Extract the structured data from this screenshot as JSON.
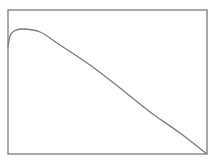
{
  "chart_data": {
    "type": "line",
    "title": "",
    "xlabel": "",
    "ylabel": "",
    "grid": false,
    "legend": null,
    "frame": {
      "x": 8,
      "y": 10,
      "width": 199,
      "height": 144
    },
    "colors": {
      "frame": "#8c8c8c",
      "line": "#7a7a7a",
      "background": "#ffffff"
    },
    "x": [
      0.0,
      0.01,
      0.03,
      0.07,
      0.16,
      0.26,
      0.41,
      0.56,
      0.71,
      0.86,
      1.0
    ],
    "values": [
      0.74,
      0.85,
      0.87,
      0.86,
      0.81,
      0.72,
      0.58,
      0.42,
      0.25,
      0.11,
      0.0
    ],
    "series": [
      {
        "name": "curve",
        "points_px": [
          [
            8,
            47
          ],
          [
            10,
            36
          ],
          [
            14,
            31
          ],
          [
            22,
            29
          ],
          [
            40,
            32
          ],
          [
            60,
            45
          ],
          [
            90,
            65
          ],
          [
            120,
            88
          ],
          [
            150,
            112
          ],
          [
            180,
            133
          ],
          [
            207,
            154
          ]
        ]
      }
    ]
  }
}
